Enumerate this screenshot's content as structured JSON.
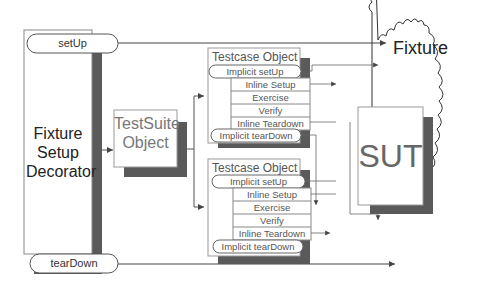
{
  "diagram": {
    "decorator": {
      "label": "Fixture Setup Decorator",
      "lines": [
        "Fixture",
        "Setup",
        "Decorator"
      ],
      "setup_pill": "setUp",
      "teardown_pill": "tearDown"
    },
    "suite": {
      "lines": [
        "TestSuite",
        "Object"
      ]
    },
    "testcases": [
      {
        "title": "Testcase Object",
        "implicit_setup": "Implicit setUp",
        "steps": [
          "Inline Setup",
          "Exercise",
          "Verify",
          "Inline Teardown"
        ],
        "implicit_teardown": "Implicit tearDown"
      },
      {
        "title": "Testcase Object",
        "implicit_setup": "Implicit setUp",
        "steps": [
          "Inline Setup",
          "Exercise",
          "Verify",
          "Inline Teardown"
        ],
        "implicit_teardown": "Implicit tearDown"
      }
    ],
    "fixture": {
      "label": "Fixture"
    },
    "sut": {
      "label": "SUT"
    },
    "colors": {
      "shadow": "#5a5a5a",
      "line": "#555555",
      "box_border": "#888888",
      "background": "#ffffff"
    }
  }
}
